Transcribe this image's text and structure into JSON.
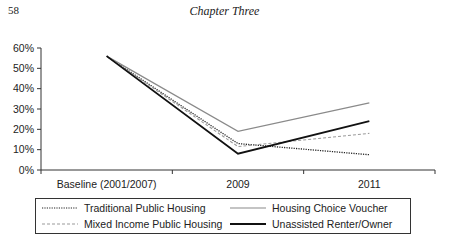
{
  "page": {
    "page_number": "58",
    "running_head": "Chapter Three"
  },
  "chart_data": {
    "type": "line",
    "title": "",
    "xlabel": "",
    "ylabel": "",
    "categories": [
      "Baseline (2001/2007)",
      "2009",
      "2011"
    ],
    "y_ticks": [
      "0%",
      "10%",
      "20%",
      "30%",
      "40%",
      "50%",
      "60%"
    ],
    "ylim": [
      0,
      60
    ],
    "grid": false,
    "legend_position": "bottom",
    "series": [
      {
        "name": "Traditional Public Housing",
        "style": "dotted",
        "color": "#222222",
        "values": [
          56,
          13,
          7.5
        ]
      },
      {
        "name": "Housing Choice Voucher",
        "style": "solid-gray",
        "color": "#8a8a8a",
        "values": [
          56,
          19,
          33
        ]
      },
      {
        "name": "Mixed Income Public Housing",
        "style": "dashed",
        "color": "#9a9a9a",
        "values": [
          56,
          11.5,
          18
        ]
      },
      {
        "name": "Unassisted Renter/Owner",
        "style": "solid-black",
        "color": "#111111",
        "values": [
          56,
          8,
          24
        ]
      }
    ]
  },
  "legend": {
    "items": [
      {
        "label": "Traditional Public Housing"
      },
      {
        "label": "Housing Choice Voucher"
      },
      {
        "label": "Mixed Income Public Housing"
      },
      {
        "label": "Unassisted Renter/Owner"
      }
    ]
  }
}
